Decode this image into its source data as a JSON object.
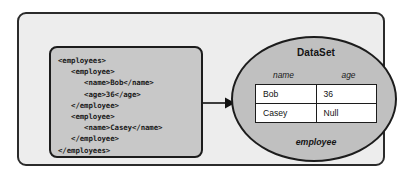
{
  "diagram": {
    "xml_source": {
      "lines": [
        "<employees>",
        "   <employee>",
        "      <name>Bob</name>",
        "      <age>36</age>",
        "   </employee>",
        "   <employee>",
        "      <name>Casey</name>",
        "   </employee>",
        "</employees>"
      ],
      "text": "<employees>\n   <employee>\n      <name>Bob</name>\n      <age>36</age>\n   </employee>\n   <employee>\n      <name>Casey</name>\n   </employee>\n</employees>"
    },
    "arrow": {
      "icon": "right-arrow-icon",
      "direction": "right"
    },
    "dataset": {
      "title": "DataSet",
      "table_name": "employee",
      "columns": [
        "name",
        "age"
      ],
      "rows": [
        {
          "name": "Bob",
          "age": "36"
        },
        {
          "name": "Casey",
          "age": "Null"
        }
      ]
    },
    "colors": {
      "outer_fill": "#ededed",
      "outer_border": "#2b2b2b",
      "code_fill": "#c8c8c8",
      "code_border": "#1c1c1c",
      "ellipse_fill": "#c0c0c0",
      "ellipse_border": "#1c1c1c",
      "cell_fill": "#ffffff",
      "text": "#141414"
    }
  }
}
